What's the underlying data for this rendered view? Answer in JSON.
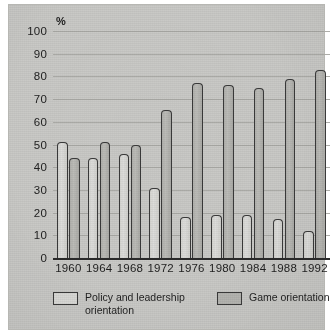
{
  "chart_data": {
    "type": "bar",
    "title": "",
    "subtitle": "",
    "xlabel": "",
    "ylabel": "%",
    "ylim": [
      0,
      100
    ],
    "ytick_step": 10,
    "grid": true,
    "legend_position": "bottom",
    "categories": [
      "1960",
      "1964",
      "1968",
      "1972",
      "1976",
      "1980",
      "1984",
      "1988",
      "1992"
    ],
    "yticks": [
      "0",
      "10",
      "20",
      "30",
      "40",
      "50",
      "60",
      "70",
      "80",
      "90",
      "100"
    ],
    "series": [
      {
        "name": "Policy and leadership orientation",
        "color": "#d9d9d6",
        "values": [
          51,
          44,
          46,
          31,
          18,
          19,
          19,
          17,
          12
        ]
      },
      {
        "name": "Game orientation",
        "color": "#b5b5b1",
        "values": [
          44,
          51,
          50,
          65,
          77,
          76,
          75,
          79,
          83
        ]
      }
    ]
  },
  "legend": {
    "items": [
      {
        "label_line1": "Policy and leadership",
        "label_line2": "orientation"
      },
      {
        "label_line1": "Game orientation",
        "label_line2": ""
      }
    ]
  },
  "axis": {
    "percent_symbol": "%"
  }
}
